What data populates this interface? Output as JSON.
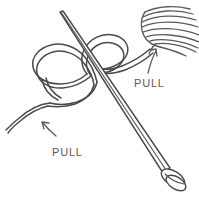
{
  "figure": {
    "background_color": "#ffffff",
    "ink_color": "#4a4a4a",
    "label_color": "#5a5a5a"
  },
  "labels": {
    "pull_upper": "PULL",
    "pull_lower": "PULL"
  },
  "annotations": [
    {
      "id": "arrow-upper",
      "name": "pull-arrow-upper",
      "label": "PULL",
      "direction": "up-right",
      "points_to": "yarn-ball-strand"
    },
    {
      "id": "arrow-lower",
      "name": "pull-arrow-lower",
      "label": "PULL",
      "direction": "up-left",
      "points_to": "yarn-tail"
    }
  ],
  "objects": {
    "needle": "knitting-needle",
    "needle_tip": "needle-tip-top-left",
    "needle_knob": "needle-knob-bottom-right",
    "yarn_ball": "yarn-ball-top-right",
    "knot": "slip-knot-loop",
    "yarn_tail": "yarn-tail-bottom-left",
    "working_yarn": "working-yarn-to-ball"
  }
}
